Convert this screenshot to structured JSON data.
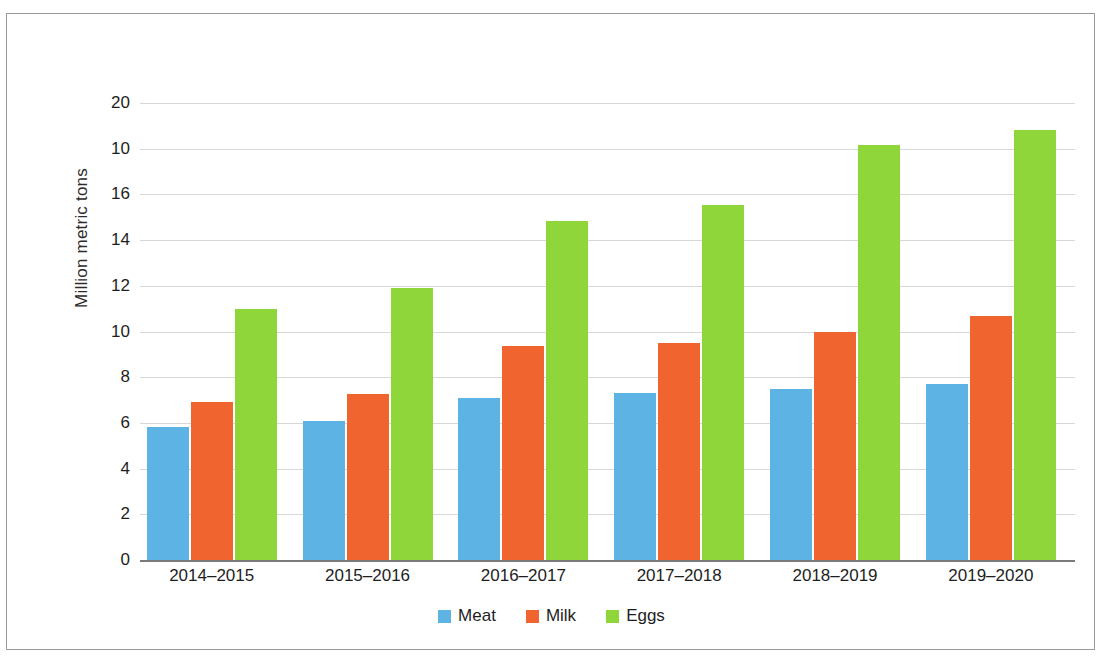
{
  "chart_data": {
    "type": "bar",
    "title": "",
    "subtitle": "",
    "xlabel": "",
    "ylabel": "Million metric tons",
    "categories": [
      "2014–2015",
      "2015–2016",
      "2016–2017",
      "2017–2018",
      "2018–2019",
      "2019–2020"
    ],
    "series": [
      {
        "name": "Meat",
        "color": "#5cb3e4",
        "values": [
          5.8,
          6.1,
          7.1,
          7.3,
          7.5,
          7.7
        ]
      },
      {
        "name": "Milk",
        "color": "#f0652f",
        "values": [
          6.9,
          7.25,
          9.35,
          9.5,
          10.0,
          10.7
        ]
      },
      {
        "name": "Eggs",
        "color": "#8ed63a",
        "values": [
          11.0,
          11.9,
          14.85,
          15.55,
          18.15,
          18.8
        ]
      }
    ],
    "ylim": [
      0,
      20
    ],
    "ytick_labels": [
      "20",
      "10",
      "16",
      "14",
      "12",
      "10",
      "8",
      "6",
      "4",
      "2",
      "0"
    ],
    "ytick_values": [
      20,
      18,
      16,
      14,
      12,
      10,
      8,
      6,
      4,
      2,
      0
    ],
    "grid": true,
    "grid_axis": "y",
    "legend_position": "bottom",
    "legend_entries": [
      "Meat",
      "Milk",
      "Eggs"
    ],
    "axis_line_color": "#7a7a7a",
    "gridline_color": "#d8d8d8",
    "text_color": "#1e1e1e",
    "background_color": "#ffffff"
  }
}
